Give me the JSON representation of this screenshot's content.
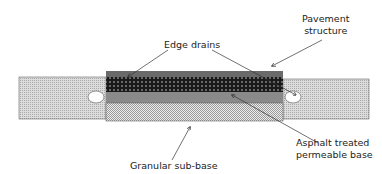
{
  "labels": {
    "pavement": [
      "Pavement",
      "structure"
    ],
    "edge_drains": "Edge drains",
    "asphalt": [
      "Asphalt treated",
      "permeable base"
    ],
    "granular": "Granular sub-base"
  },
  "colors": {
    "surface": "#6a6a6a",
    "open_graded": "#1a1a1a",
    "shoulder": "#d0d0d0",
    "atpb": "#8a8a8a",
    "subbase": "#cfcfcf"
  }
}
